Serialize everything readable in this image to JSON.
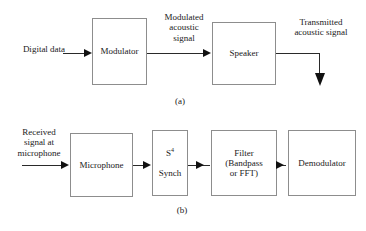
{
  "figure": {
    "caption_a": "(a)",
    "caption_b": "(b)",
    "diagram_a": {
      "name": "transmitter-chain",
      "input_label": "Digital data",
      "blocks": [
        {
          "name": "modulator",
          "label": "Modulator"
        },
        {
          "name": "speaker",
          "label": "Speaker"
        }
      ],
      "signal_labels": [
        {
          "name": "modulated-acoustic-signal",
          "text": "Modulated\nacoustic\nsignal"
        },
        {
          "name": "transmitted-acoustic-signal",
          "text": "Transmitted\nacoustic signal"
        }
      ]
    },
    "diagram_b": {
      "name": "receiver-chain",
      "input_label": "Received\nsignal at\nmicrophone",
      "blocks": [
        {
          "name": "microphone",
          "label": "Microphone"
        },
        {
          "name": "s4-synch",
          "label_main": "S",
          "label_sup": "4",
          "label_sub": "Synch"
        },
        {
          "name": "filter",
          "label": "Filter\n(Bandpass\nor FFT)"
        },
        {
          "name": "demodulator",
          "label": "Demodulator"
        }
      ]
    }
  },
  "colors": {
    "background": "#ffffff",
    "box_border": "#8d8d8d",
    "line": "#2a2a2a",
    "arrow_fill": "#111111",
    "text": "#1a1a1a"
  }
}
